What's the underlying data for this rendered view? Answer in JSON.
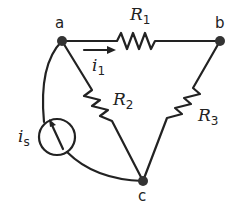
{
  "diagram": {
    "type": "circuit",
    "nodes": [
      {
        "id": "a",
        "label": "a"
      },
      {
        "id": "b",
        "label": "b"
      },
      {
        "id": "c",
        "label": "c"
      }
    ],
    "components": [
      {
        "id": "R1",
        "type": "resistor",
        "label": "R",
        "subscript": "1",
        "from": "a",
        "to": "b"
      },
      {
        "id": "R2",
        "type": "resistor",
        "label": "R",
        "subscript": "2",
        "from": "a",
        "to": "c"
      },
      {
        "id": "R3",
        "type": "resistor",
        "label": "R",
        "subscript": "3",
        "from": "b",
        "to": "c"
      },
      {
        "id": "is",
        "type": "current-source",
        "label": "i",
        "subscript": "s",
        "from": "c",
        "to": "a"
      }
    ],
    "currents": [
      {
        "id": "i1",
        "label": "i",
        "subscript": "1",
        "direction": "a-to-b"
      }
    ],
    "colors": {
      "wire": "#222222",
      "node": "#333333"
    }
  }
}
